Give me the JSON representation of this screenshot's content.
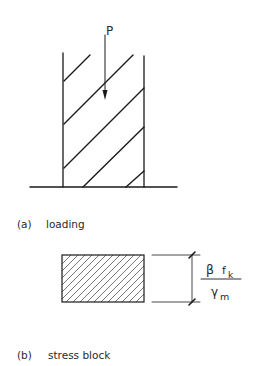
{
  "figure_a": {
    "load_label": "P",
    "caption_marker": "(a)",
    "caption_text": "loading"
  },
  "figure_b": {
    "fraction_numerator_symbol": "β",
    "fraction_numerator_var": "f",
    "fraction_numerator_sub": "k",
    "fraction_denominator_symbol": "γ",
    "fraction_denominator_sub": "m",
    "caption_marker": "(b)",
    "caption_text": "stress block"
  },
  "colors": {
    "line": "#1a1a1a",
    "hatch": "#555555",
    "background": "#ffffff"
  }
}
